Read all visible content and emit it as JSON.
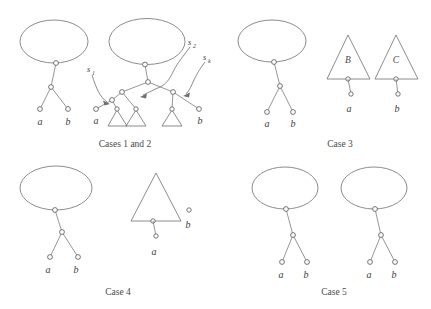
{
  "figure": {
    "captions": {
      "panel1": "Cases 1 and 2",
      "panel2": "Case 3",
      "panel3": "Case 4",
      "panel4": "Case 5"
    },
    "colors": {
      "stroke": "#6f6f6f",
      "node_stroke": "#5d5d5d",
      "node_fill": "#ffffff",
      "text": "#3d3d3d",
      "background": "#ffffff"
    },
    "panels": [
      {
        "id": "panel-cases-1-and-2",
        "caption": "Cases 1 and 2",
        "leaf_labels": [
          "a",
          "b",
          "a",
          "b"
        ],
        "annotations": [
          {
            "name": "s1",
            "base": "s",
            "sub": "1"
          },
          {
            "name": "s2",
            "base": "s",
            "sub": "2"
          },
          {
            "name": "sk",
            "base": "s",
            "sub": "k"
          }
        ]
      },
      {
        "id": "panel-case-3",
        "caption": "Case 3",
        "leaf_labels": [
          "a",
          "b",
          "a",
          "b"
        ],
        "subtree_labels": [
          "B",
          "C"
        ]
      },
      {
        "id": "panel-case-4",
        "caption": "Case 4",
        "leaf_labels": [
          "a",
          "b",
          "a",
          "b"
        ],
        "subtree_labels": []
      },
      {
        "id": "panel-case-5",
        "caption": "Case 5",
        "leaf_labels": [
          "a",
          "b",
          "a",
          "b"
        ]
      }
    ],
    "labels": {
      "a": "a",
      "b": "b",
      "B": "B",
      "C": "C",
      "s": "s",
      "sub1": "1",
      "sub2": "2",
      "subk": "k"
    }
  }
}
